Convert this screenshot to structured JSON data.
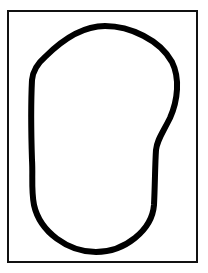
{
  "figure": {
    "colors": {
      "background": "#ffffff",
      "frame_stroke": "#111111",
      "curve_stroke": "#000000"
    },
    "frame": {
      "x": 8,
      "y": 11,
      "width": 189,
      "height": 251,
      "stroke_width": 2
    },
    "curve": {
      "stroke_width": 6,
      "path": "M 105 26 C 130 26 160 40 172 62 C 180 78 178 100 170 118 C 162 134 157 140 156 150 C 155 165 155 185 154 205 C 152 230 125 252 96 252 C 68 252 40 232 34 205 C 31 190 33 175 32 160 C 31 130 31 100 32 80 C 33 70 38 63 45 57 C 60 42 80 26 105 26 Z"
    }
  }
}
